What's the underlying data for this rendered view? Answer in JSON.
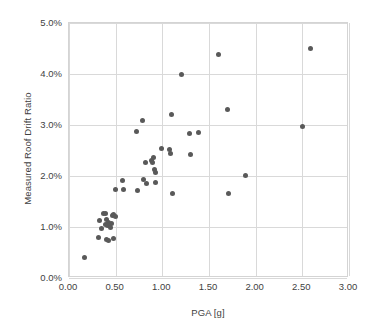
{
  "chart_data": {
    "type": "scatter",
    "title": "",
    "xlabel": "PGA [g]",
    "ylabel": "Measured Roof Drift Ratio",
    "xlim": [
      0.0,
      3.0
    ],
    "ylim": [
      0.0,
      5.0
    ],
    "xticks": [
      "0.00",
      "0.50",
      "1.00",
      "1.50",
      "2.00",
      "2.50",
      "3.00"
    ],
    "xtick_values": [
      0.0,
      0.5,
      1.0,
      1.5,
      2.0,
      2.5,
      3.0
    ],
    "yticks": [
      "0.0%",
      "1.0%",
      "2.0%",
      "3.0%",
      "4.0%",
      "5.0%"
    ],
    "ytick_values": [
      0.0,
      1.0,
      2.0,
      3.0,
      4.0,
      5.0
    ],
    "grid": true,
    "legend": "none",
    "marker_color": "#595959",
    "marker_size_px": 5,
    "units": {
      "x": "g",
      "y": "percent"
    },
    "series": [
      {
        "name": "Measured roof drift vs PGA",
        "points": [
          [
            0.17,
            0.4
          ],
          [
            0.32,
            0.79
          ],
          [
            0.33,
            1.13
          ],
          [
            0.35,
            0.97
          ],
          [
            0.37,
            1.27
          ],
          [
            0.39,
            1.27
          ],
          [
            0.39,
            1.04
          ],
          [
            0.4,
            1.15
          ],
          [
            0.4,
            0.75
          ],
          [
            0.41,
            1.02
          ],
          [
            0.42,
            1.08
          ],
          [
            0.42,
            0.73
          ],
          [
            0.43,
            1.05
          ],
          [
            0.44,
            1.0
          ],
          [
            0.46,
            1.06
          ],
          [
            0.47,
            1.23
          ],
          [
            0.48,
            1.24
          ],
          [
            0.48,
            0.78
          ],
          [
            0.5,
            1.21
          ],
          [
            0.5,
            1.73
          ],
          [
            0.57,
            1.92
          ],
          [
            0.58,
            1.74
          ],
          [
            0.72,
            2.88
          ],
          [
            0.73,
            1.71
          ],
          [
            0.79,
            3.09
          ],
          [
            0.8,
            1.93
          ],
          [
            0.82,
            2.27
          ],
          [
            0.83,
            1.86
          ],
          [
            0.88,
            2.31
          ],
          [
            0.89,
            2.26
          ],
          [
            0.91,
            2.36
          ],
          [
            0.92,
            2.12
          ],
          [
            0.93,
            2.07
          ],
          [
            0.93,
            1.88
          ],
          [
            0.99,
            2.53
          ],
          [
            1.08,
            2.52
          ],
          [
            1.09,
            2.45
          ],
          [
            1.1,
            3.2
          ],
          [
            1.11,
            1.66
          ],
          [
            1.2,
            4.0
          ],
          [
            1.29,
            2.84
          ],
          [
            1.3,
            2.43
          ],
          [
            1.39,
            2.85
          ],
          [
            1.6,
            4.39
          ],
          [
            1.7,
            3.3
          ],
          [
            1.71,
            1.66
          ],
          [
            1.89,
            2.01
          ],
          [
            2.5,
            2.97
          ],
          [
            2.59,
            4.5
          ]
        ]
      }
    ]
  }
}
